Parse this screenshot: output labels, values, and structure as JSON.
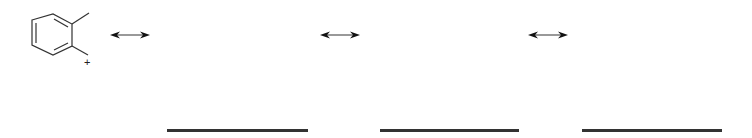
{
  "molecule": {
    "name": "ortho-methylbenzyl cation",
    "charge_label": "+"
  },
  "arrows": [
    {
      "type": "resonance",
      "x": 110,
      "y": 35
    },
    {
      "type": "resonance",
      "x": 320,
      "y": 35
    },
    {
      "type": "resonance",
      "x": 528,
      "y": 35
    }
  ],
  "blanks": [
    {
      "x": 167,
      "width": 141
    },
    {
      "x": 380,
      "width": 139
    },
    {
      "x": 582,
      "width": 140
    }
  ]
}
